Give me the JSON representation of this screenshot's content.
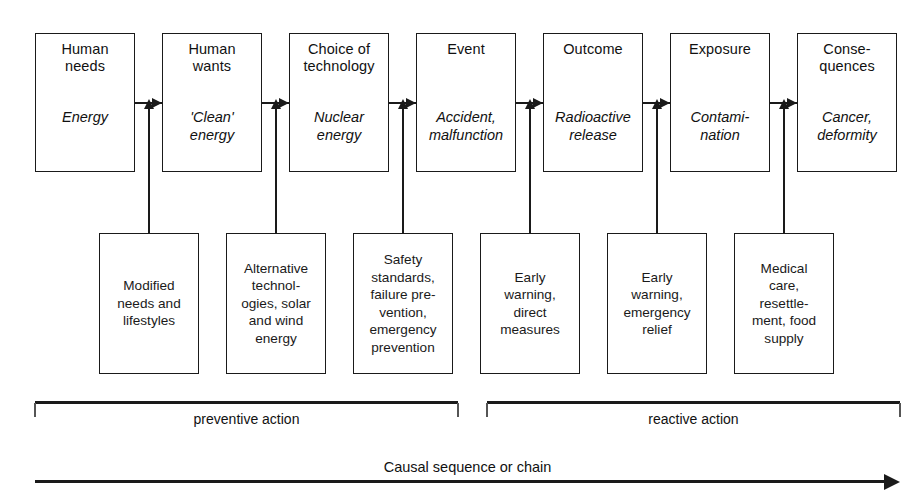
{
  "diagram": {
    "stages": [
      {
        "title": "Human\nneeds",
        "example": "Energy",
        "x": 35,
        "y": 33,
        "w": 100,
        "h": 139
      },
      {
        "title": "Human\nwants",
        "example": "'Clean'\nenergy",
        "x": 162,
        "y": 33,
        "w": 100,
        "h": 139
      },
      {
        "title": "Choice of\ntechnology",
        "example": "Nuclear\nenergy",
        "x": 289,
        "y": 33,
        "w": 100,
        "h": 139
      },
      {
        "title": "Event",
        "example": "Accident,\nmalfunction",
        "x": 416,
        "y": 33,
        "w": 100,
        "h": 139
      },
      {
        "title": "Outcome",
        "example": "Radioactive\nrelease",
        "x": 543,
        "y": 33,
        "w": 100,
        "h": 139
      },
      {
        "title": "Exposure",
        "example": "Contami-\nnation",
        "x": 670,
        "y": 33,
        "w": 100,
        "h": 139
      },
      {
        "title": "Conse-\nquences",
        "example": "Cancer,\ndeformity",
        "x": 797,
        "y": 33,
        "w": 100,
        "h": 139
      }
    ],
    "actions": [
      {
        "text": "Modified\nneeds and\nlifestyles",
        "x": 99,
        "y": 233,
        "w": 100,
        "h": 141
      },
      {
        "text": "Alternative\ntechnol-\nogies, solar\nand wind\nenergy",
        "x": 226,
        "y": 233,
        "w": 100,
        "h": 141
      },
      {
        "text": "Safety\nstandards,\nfailure pre-\nvention,\nemergency\nprevention",
        "x": 353,
        "y": 233,
        "w": 100,
        "h": 141
      },
      {
        "text": "Early\nwarning,\ndirect\nmeasures",
        "x": 480,
        "y": 233,
        "w": 100,
        "h": 141
      },
      {
        "text": "Early\nwarning,\nemergency\nrelief",
        "x": 607,
        "y": 233,
        "w": 100,
        "h": 141
      },
      {
        "text": "Medical\ncare,\nresettle-\nment, food\nsupply",
        "x": 734,
        "y": 233,
        "w": 100,
        "h": 141
      }
    ],
    "brackets": [
      {
        "label": "preventive action",
        "x1": 35,
        "x2": 458,
        "y": 401
      },
      {
        "label": "reactive action",
        "x1": 487,
        "x2": 900,
        "y": 401
      }
    ],
    "axis": {
      "label": "Causal sequence or chain",
      "x1": 35,
      "x2": 900,
      "y": 480
    },
    "colors": {
      "stroke": "#1a1a1a",
      "text": "#111111",
      "background": "#ffffff"
    }
  }
}
